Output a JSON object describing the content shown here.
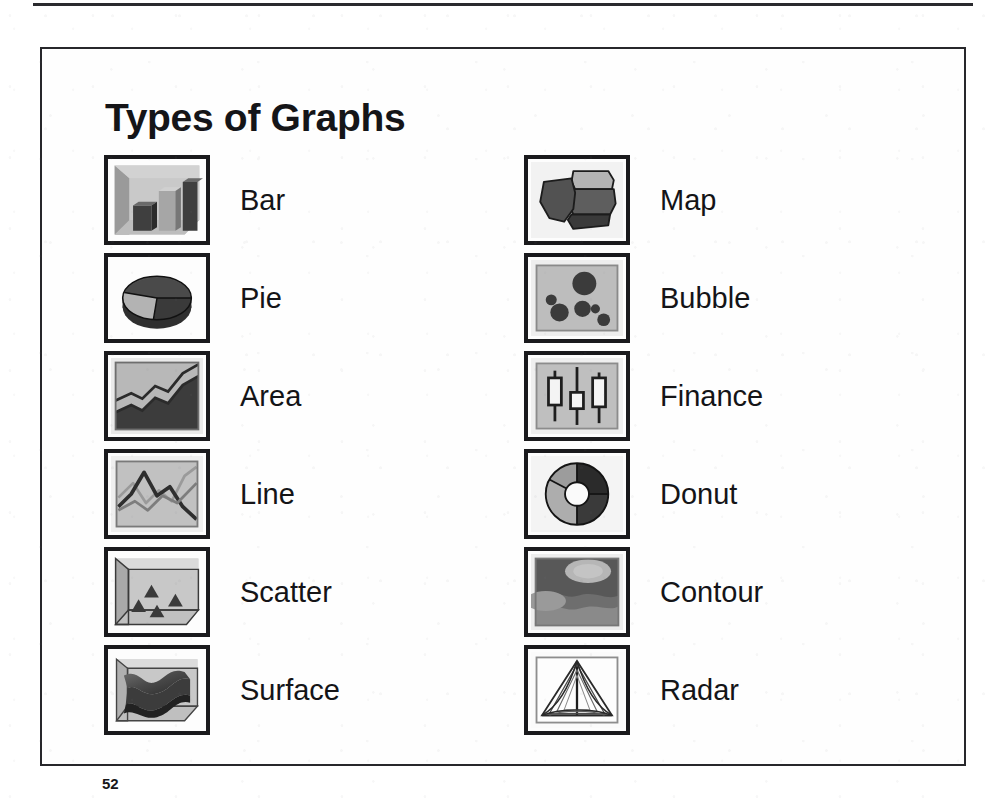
{
  "slide": {
    "title": "Types of Graphs",
    "page_number": "52",
    "columns": [
      {
        "name": "left-column",
        "items": [
          {
            "label": "Bar",
            "icon": "bar-chart-icon"
          },
          {
            "label": "Pie",
            "icon": "pie-chart-icon"
          },
          {
            "label": "Area",
            "icon": "area-chart-icon"
          },
          {
            "label": "Line",
            "icon": "line-chart-icon"
          },
          {
            "label": "Scatter",
            "icon": "scatter-chart-icon"
          },
          {
            "label": "Surface",
            "icon": "surface-chart-icon"
          }
        ]
      },
      {
        "name": "right-column",
        "items": [
          {
            "label": "Map",
            "icon": "map-chart-icon"
          },
          {
            "label": "Bubble",
            "icon": "bubble-chart-icon"
          },
          {
            "label": "Finance",
            "icon": "finance-chart-icon"
          },
          {
            "label": "Donut",
            "icon": "donut-chart-icon"
          },
          {
            "label": "Contour",
            "icon": "contour-chart-icon"
          },
          {
            "label": "Radar",
            "icon": "radar-chart-icon"
          }
        ]
      }
    ]
  },
  "colors": {
    "ink": "#1a1a1d",
    "frame": "#27272b",
    "paper": "#fefefe",
    "light_gray": "#b9b9b9",
    "mid_gray": "#8e8e8e",
    "dark_gray": "#575757",
    "near_black": "#3a3a3a"
  }
}
